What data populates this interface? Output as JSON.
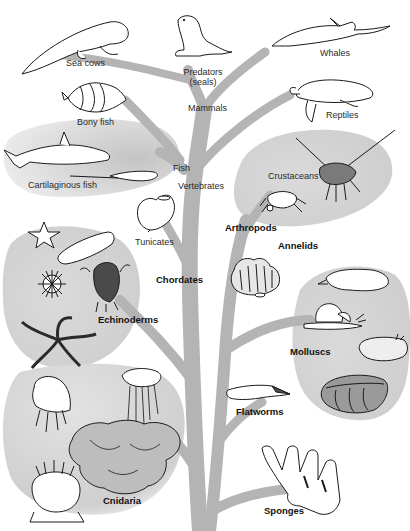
{
  "diagram": {
    "title": "",
    "colors": {
      "background": "#ffffff",
      "branch": "#b4b4b4",
      "group_fill": "#d6d6d6",
      "ink": "#1a1a1a"
    },
    "groups": {
      "vertebrates_fish": {
        "label": "Cartilaginous fish"
      },
      "echinoderms": {
        "label": "Echinoderms"
      },
      "crustaceans": {
        "label": "Crustaceans"
      },
      "molluscs": {
        "label": "Molluscs"
      },
      "cnidaria": {
        "label": "Cnidaria"
      }
    },
    "labels": {
      "sea_cows": "Sea cows",
      "predators_line1": "Predators",
      "predators_line2": "(seals)",
      "whales": "Whales",
      "mammals": "Mammals",
      "bony_fish": "Bony fish",
      "reptiles": "Reptiles",
      "cartilaginous_fish": "Cartilaginous fish",
      "fish": "Fish",
      "vertebrates": "Vertebrates",
      "crustaceans": "Crustaceans",
      "tunicates": "Tunicates",
      "arthropods": "Arthropods",
      "annelids": "Annelids",
      "chordates": "Chordates",
      "echinoderms": "Echinoderms",
      "molluscs": "Molluscs",
      "flatworms": "Flatworms",
      "cnidaria": "Cnidaria",
      "sponges": "Sponges"
    },
    "icons": [
      "sea-cow-icon",
      "seal-icon",
      "dolphin-icon",
      "angelfish-icon",
      "turtle-icon",
      "shark-icon",
      "ray-icon",
      "tunicate-icon",
      "crab-icon",
      "lobster-icon",
      "starfish-icon",
      "sea-cucumber-icon",
      "sea-urchin-icon",
      "feather-star-icon",
      "brittle-star-icon",
      "tubeworm-icon",
      "cuttlefish-icon",
      "snail-icon",
      "sea-slug-icon",
      "clam-icon",
      "flatworm-icon",
      "jellyfish-icon",
      "portuguese-man-o-war-icon",
      "coral-icon",
      "sea-anemone-icon",
      "sponge-icon"
    ]
  }
}
